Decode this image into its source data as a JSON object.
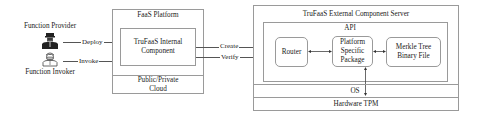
{
  "actors": {
    "provider": {
      "label": "Function Provider",
      "icon": "person-with-cap-icon"
    },
    "invoker": {
      "label": "Function Invoker",
      "icon": "person-with-mask-icon"
    }
  },
  "faas_platform": {
    "title": "FaaS Platform",
    "internal_component": {
      "line1": "TruFaaS Internal",
      "line2": "Component"
    },
    "cloud": {
      "line1": "Public/Private",
      "line2": "Cloud"
    }
  },
  "server": {
    "title": "TruFaaS External Component Server",
    "api": {
      "title": "API",
      "router": "Router",
      "platform_package": {
        "line1": "Platform",
        "line2": "Specific",
        "line3": "Package"
      },
      "merkle": {
        "line1": "Merkle Tree",
        "line2": "Binary File"
      }
    },
    "os": "OS",
    "hardware": "Hardware TPM"
  },
  "edges": {
    "deploy": "Deploy",
    "invoke": "Invoke",
    "create": "Create",
    "verify": "Verify"
  },
  "colors": {
    "border": "#9a9a9a",
    "line": "#555555",
    "text": "#222222"
  }
}
